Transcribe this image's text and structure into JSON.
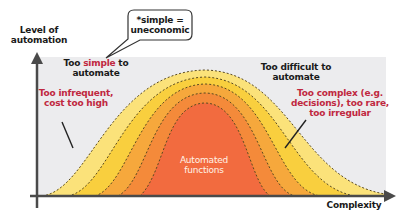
{
  "diagram": {
    "y_axis_label_line1": "Level of",
    "y_axis_label_line2": "automation",
    "x_axis_label": "Complexity",
    "callout": {
      "line1": "*simple =",
      "line2": "uneconomic"
    },
    "left_heading": {
      "prefix": "Too ",
      "highlight": "simple",
      "suffix": " to",
      "line2": "automate"
    },
    "left_reason_line1": "Too infrequent,",
    "left_reason_line2": "cost too high",
    "right_heading_line1": "Too difficult to",
    "right_heading_line2": "automate",
    "right_reason_line1": "Too complex (e.g.",
    "right_reason_line2": "decisions), too rare,",
    "right_reason_line3": "too irregular",
    "center_label_line1": "Automated",
    "center_label_line2": "functions"
  },
  "colors": {
    "panel_bg": "#ececee",
    "band_1": "#fbe27a",
    "band_2": "#f9cf3e",
    "band_3": "#f6a83c",
    "band_4": "#f48a3a",
    "band_5": "#f26b3f",
    "axis": "#4a4a4a",
    "red_text": "#c0283f"
  }
}
